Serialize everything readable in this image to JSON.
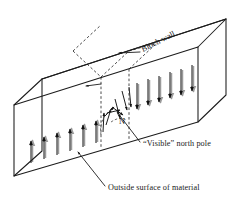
{
  "figure": {
    "type": "technical-line-diagram",
    "background_color": "#ffffff",
    "line_color": "#1c1c1c",
    "shadow_color": "#9a9a9a",
    "labels": {
      "bloch_wall": "Bloch wall",
      "visible_north_pole": "“Visible” north pole",
      "outside_surface": "Outside surface of material",
      "north_pole_marker": "N"
    },
    "annotations": [
      {
        "name": "bloch-wall",
        "text": "Bloch wall",
        "rotation_deg": -27,
        "leader": "horizontal arrow pointing left to top of wall"
      },
      {
        "name": "visible-north-pole",
        "text": "“Visible” north pole",
        "rotation_deg": 0,
        "leader": "diagonal line up-left to wall front face"
      },
      {
        "name": "outside-surface-of-material",
        "text": "Outside surface of material",
        "rotation_deg": 0,
        "leader": "diagonal line up-left to front face"
      },
      {
        "name": "north-pole-marker",
        "text": "N",
        "rotation_deg": 0,
        "leader": "none"
      }
    ],
    "domains": {
      "left_domain": {
        "name": "left-domain-up-magnetization",
        "direction": "up",
        "arrow_count": 7
      },
      "right_domain": {
        "name": "right-domain-down-magnetization",
        "direction": "down",
        "arrow_count": 7
      },
      "wall_region": {
        "name": "bloch-wall-spin-rotation",
        "description": "spins rotate progressively from up to down through the wall",
        "spin_count": 8
      }
    },
    "block": {
      "name": "ferromagnetic-block",
      "shape": "rectangular slab in oblique projection",
      "visible_faces": [
        "front",
        "top",
        "left-end"
      ]
    }
  }
}
